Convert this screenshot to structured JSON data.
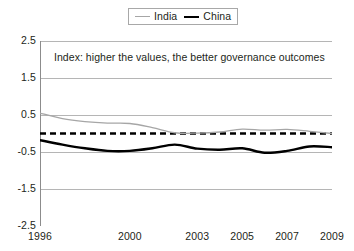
{
  "chart_data": {
    "type": "line",
    "title": "",
    "annotation": "Index: higher the values, the better governance outcomes",
    "xlabel": "",
    "ylabel": "",
    "ylim": [
      -2.5,
      2.5
    ],
    "xlim": [
      1996,
      2009
    ],
    "grid": true,
    "legend_position": "top-center",
    "yticks": [
      "2.5",
      "1.5",
      "0.5",
      "-0.5",
      "-1.5",
      "-2.5"
    ],
    "ytick_values": [
      2.5,
      1.5,
      0.5,
      -0.5,
      -1.5,
      -2.5
    ],
    "xticks": [
      "1996",
      "2000",
      "2003",
      "2005",
      "2007",
      "2009"
    ],
    "xtick_values": [
      1996,
      2000,
      2003,
      2005,
      2007,
      2009
    ],
    "x": [
      1996,
      1997,
      1998,
      1999,
      2000,
      2001,
      2002,
      2003,
      2004,
      2005,
      2006,
      2007,
      2008,
      2009
    ],
    "reference_line": {
      "value": 0,
      "style": "dashed",
      "color": "#000000"
    },
    "series": [
      {
        "name": "India",
        "color": "#a6a6a6",
        "width": 1.3,
        "values": [
          0.55,
          0.4,
          0.32,
          0.28,
          0.27,
          0.16,
          0.02,
          0.01,
          0.04,
          0.12,
          0.09,
          0.11,
          0.06,
          0.0
        ]
      },
      {
        "name": "China",
        "color": "#000000",
        "width": 2.4,
        "values": [
          -0.18,
          -0.3,
          -0.4,
          -0.47,
          -0.47,
          -0.4,
          -0.3,
          -0.41,
          -0.44,
          -0.4,
          -0.52,
          -0.47,
          -0.35,
          -0.37
        ]
      }
    ]
  },
  "legend": {
    "entries": [
      {
        "label": "India",
        "icon": "thin-gray-line-icon"
      },
      {
        "label": "China",
        "icon": "thick-black-line-icon"
      }
    ]
  }
}
